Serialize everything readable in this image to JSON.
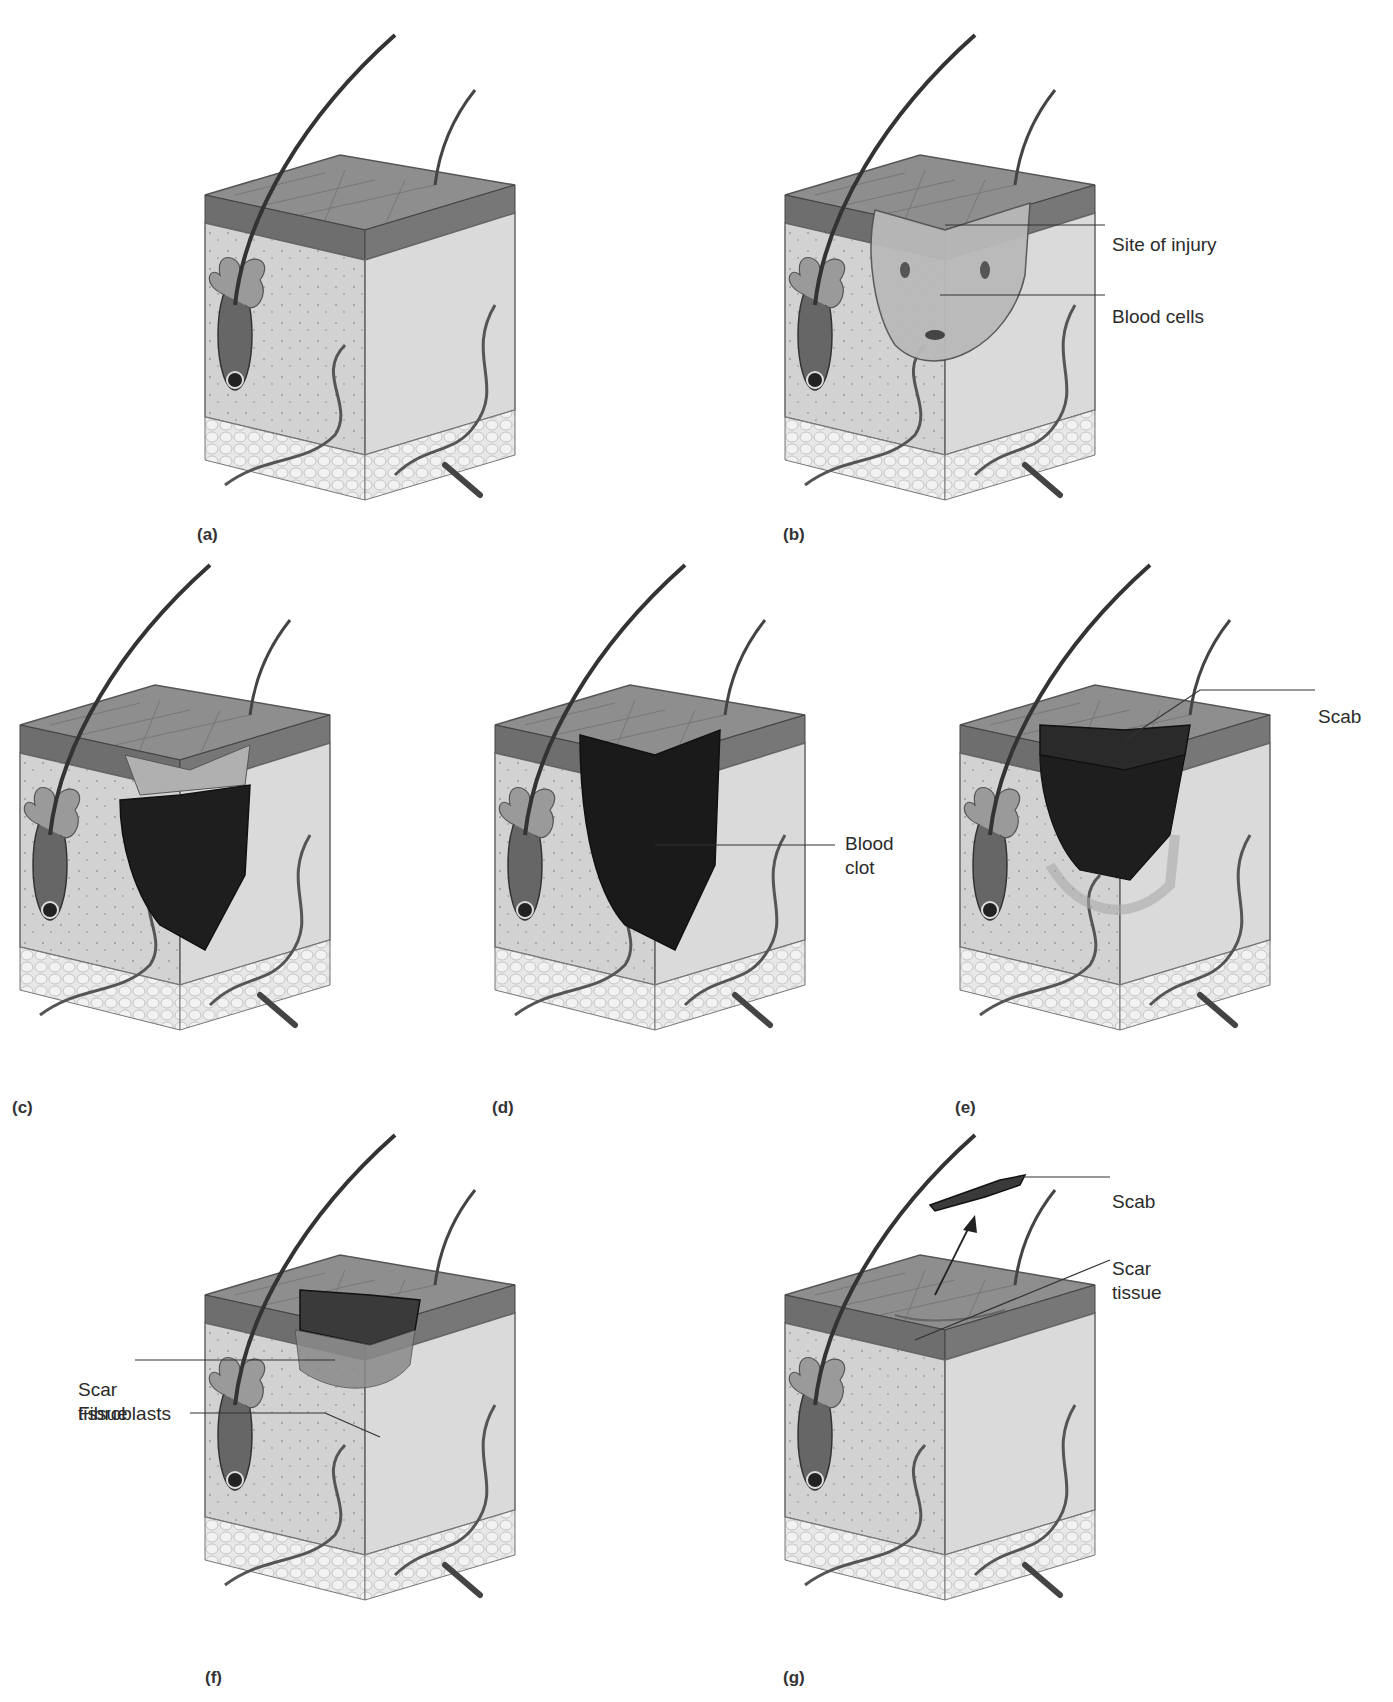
{
  "figure": {
    "topic": "Stages of skin wound healing",
    "colors": {
      "skin_top": "#8c8c8c",
      "epidermis": "#6f6f6f",
      "dermis_front": "#cfcfcf",
      "dermis_side": "#dcdcdc",
      "fat": "#e6e6e6",
      "clot": "#1c1c1c",
      "injury": "#b5b5b5",
      "line": "#333333"
    },
    "panels": [
      {
        "id": "a",
        "label": "(a)",
        "annotations": []
      },
      {
        "id": "b",
        "label": "(b)",
        "annotations": [
          "Site of injury",
          "Blood cells"
        ]
      },
      {
        "id": "c",
        "label": "(c)",
        "annotations": []
      },
      {
        "id": "d",
        "label": "(d)",
        "annotations": [
          "Blood\nclot"
        ]
      },
      {
        "id": "e",
        "label": "(e)",
        "annotations": [
          "Scab"
        ]
      },
      {
        "id": "f",
        "label": "(f)",
        "annotations": [
          "Scar\ntissue",
          "Fibroblasts"
        ]
      },
      {
        "id": "g",
        "label": "(g)",
        "annotations": [
          "Scab",
          "Scar\ntissue"
        ]
      }
    ]
  }
}
